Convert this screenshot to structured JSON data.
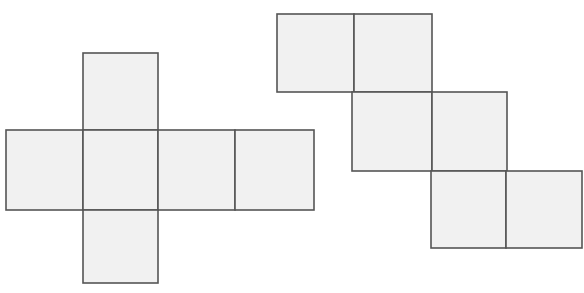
{
  "figure": {
    "title": "Two cube nets",
    "canvas": {
      "width": 584,
      "height": 293,
      "background": "#ffffff"
    },
    "style": {
      "face_fill": "#f1f1f1",
      "face_stroke": "#555555",
      "stroke_width": 1.6
    },
    "nets": [
      {
        "id": "net-left-cross",
        "name": "cross-net",
        "label": "Cross shaped cube net",
        "cell_size": 76,
        "faces": [
          {
            "name": "top-face",
            "x": 83,
            "y": 53,
            "w": 75,
            "h": 77
          },
          {
            "name": "middle-left-face",
            "x": 6,
            "y": 130,
            "w": 77,
            "h": 80
          },
          {
            "name": "center-face",
            "x": 83,
            "y": 130,
            "w": 75,
            "h": 80
          },
          {
            "name": "middle-right-face",
            "x": 158,
            "y": 130,
            "w": 77,
            "h": 80
          },
          {
            "name": "far-right-face",
            "x": 235,
            "y": 130,
            "w": 79,
            "h": 80
          },
          {
            "name": "bottom-face",
            "x": 83,
            "y": 210,
            "w": 75,
            "h": 73
          }
        ]
      },
      {
        "id": "net-right-staircase",
        "name": "staircase-net",
        "label": "Staircase shaped cube net",
        "cell_size": 77,
        "faces": [
          {
            "name": "upper-left-face",
            "x": 277,
            "y": 14,
            "w": 77,
            "h": 78
          },
          {
            "name": "upper-right-face",
            "x": 354,
            "y": 14,
            "w": 78,
            "h": 78
          },
          {
            "name": "middle-left-face",
            "x": 352,
            "y": 92,
            "w": 80,
            "h": 79
          },
          {
            "name": "middle-right-face",
            "x": 432,
            "y": 92,
            "w": 75,
            "h": 79
          },
          {
            "name": "lower-left-face",
            "x": 431,
            "y": 171,
            "w": 75,
            "h": 77
          },
          {
            "name": "lower-right-face",
            "x": 506,
            "y": 171,
            "w": 76,
            "h": 77
          }
        ]
      }
    ]
  }
}
